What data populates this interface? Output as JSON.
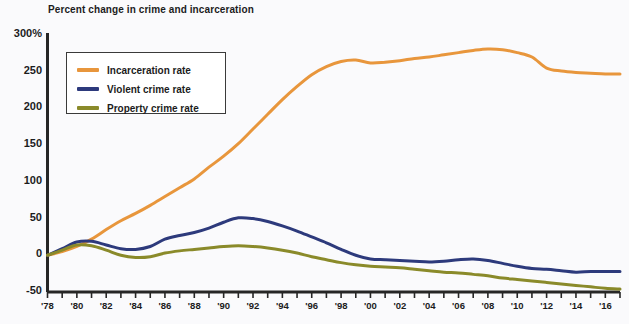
{
  "chart_data": {
    "type": "line",
    "title": "Percent change in crime and incarceration",
    "xlabel": "",
    "ylabel": "",
    "ylim": [
      -50,
      300
    ],
    "xlim": [
      1978,
      2017
    ],
    "grid": false,
    "legend_position": "top-left-inside",
    "y_ticks": [
      "300%",
      "250",
      "200",
      "150",
      "100",
      "50",
      "0",
      "-50"
    ],
    "y_tick_values": [
      300,
      250,
      200,
      150,
      100,
      50,
      0,
      -50
    ],
    "x_ticks": [
      "'78",
      "'80",
      "'82",
      "'84",
      "'86",
      "'88",
      "'90",
      "'92",
      "'94",
      "'96",
      "'98",
      "'00",
      "'02",
      "'04",
      "'06",
      "'08",
      "'10",
      "'12",
      "'14",
      "'16"
    ],
    "x_tick_values": [
      1978,
      1980,
      1982,
      1984,
      1986,
      1988,
      1990,
      1992,
      1994,
      1996,
      1998,
      2000,
      2002,
      2004,
      2006,
      2008,
      2010,
      2012,
      2014,
      2016
    ],
    "x": [
      1978,
      1979,
      1980,
      1981,
      1982,
      1983,
      1984,
      1985,
      1986,
      1987,
      1988,
      1989,
      1990,
      1991,
      1992,
      1993,
      1994,
      1995,
      1996,
      1997,
      1998,
      1999,
      2000,
      2001,
      2002,
      2003,
      2004,
      2005,
      2006,
      2007,
      2008,
      2009,
      2010,
      2011,
      2012,
      2013,
      2014,
      2015,
      2016,
      2017
    ],
    "series": [
      {
        "name": "Incarceration rate",
        "color": "#E8963C",
        "values": [
          0,
          5,
          12,
          22,
          35,
          47,
          57,
          68,
          80,
          92,
          104,
          120,
          135,
          152,
          172,
          192,
          212,
          230,
          246,
          257,
          264,
          266,
          262,
          263,
          265,
          268,
          270,
          273,
          276,
          279,
          281,
          280,
          276,
          270,
          255,
          251,
          249,
          248,
          247,
          247
        ]
      },
      {
        "name": "Violent crime rate",
        "color": "#2D3A7C",
        "values": [
          0,
          9,
          18,
          19,
          14,
          9,
          8,
          12,
          22,
          27,
          31,
          37,
          45,
          51,
          50,
          46,
          40,
          33,
          25,
          17,
          8,
          0,
          -5,
          -6,
          -7,
          -8,
          -9,
          -8,
          -6,
          -5,
          -7,
          -11,
          -15,
          -18,
          -19,
          -21,
          -23,
          -22,
          -22,
          -22
        ]
      },
      {
        "name": "Property crime rate",
        "color": "#8A8A2A",
        "values": [
          0,
          7,
          14,
          13,
          7,
          0,
          -3,
          -2,
          3,
          6,
          8,
          10,
          12,
          13,
          12,
          10,
          7,
          3,
          -2,
          -6,
          -10,
          -13,
          -15,
          -16,
          -17,
          -19,
          -21,
          -23,
          -24,
          -26,
          -28,
          -31,
          -33,
          -35,
          -37,
          -39,
          -41,
          -43,
          -45,
          -46
        ]
      }
    ]
  },
  "legend": {
    "items": [
      {
        "label": "Incarceration rate",
        "color": "#E8963C"
      },
      {
        "label": "Violent crime rate",
        "color": "#2D3A7C"
      },
      {
        "label": "Property crime rate",
        "color": "#8A8A2A"
      }
    ]
  },
  "axis": {
    "line_color": "#262626"
  }
}
